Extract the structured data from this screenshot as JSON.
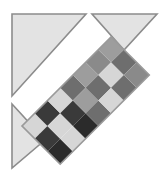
{
  "canvas": {
    "width": 166,
    "height": 178,
    "background": "#ffffff",
    "title": "Abstract geometric figure: three light triangles with diagonal checkered band"
  },
  "palette": {
    "background": "#ffffff",
    "triangle_fill": "#e3e3e3",
    "triangle_stroke": "#8c8c8c",
    "band_stroke": "#9a9a9a",
    "cell_black": "#2b2b2b",
    "cell_dark": "#3a3a3a",
    "cell_mid_dark": "#6e6e6e",
    "cell_mid": "#8a8a8a",
    "cell_mid_light": "#9d9d9d",
    "cell_light": "#d6d6d6",
    "cell_lighter": "#e0e0e0"
  },
  "triangles": [
    {
      "name": "top-left-triangle",
      "points": "12,14 86,14 12,96",
      "fill": "#e3e3e3",
      "stroke": "#8c8c8c",
      "stroke_width": 1.6
    },
    {
      "name": "top-right-triangle",
      "points": "92,14 157,14 124,50",
      "fill": "#e3e3e3",
      "stroke": "#8c8c8c",
      "stroke_width": 1.6
    },
    {
      "name": "bottom-left-triangle",
      "points": "12,104 45,140 12,168",
      "fill": "#e3e3e3",
      "stroke": "#8c8c8c",
      "stroke_width": 1.6
    }
  ],
  "band": {
    "name": "diagonal-checker-band",
    "angle_deg": -45,
    "origin_x": 22,
    "origin_y": 126,
    "cols": 7,
    "rows": 3,
    "cell": 18,
    "stroke": "#9a9a9a",
    "stroke_width": 1.6,
    "grid": [
      [
        "#d6d6d6",
        "#3a3a3a",
        "#d6d6d6",
        "#6e6e6e",
        "#9d9d9d",
        "#8a8a8a",
        "#9d9d9d"
      ],
      [
        "#3a3a3a",
        "#d6d6d6",
        "#3a3a3a",
        "#9d9d9d",
        "#6e6e6e",
        "#d6d6d6",
        "#6e6e6e"
      ],
      [
        "#2b2b2b",
        "#d6d6d6",
        "#2b2b2b",
        "#6e6e6e",
        "#d6d6d6",
        "#6e6e6e",
        "#8a8a8a"
      ]
    ]
  }
}
